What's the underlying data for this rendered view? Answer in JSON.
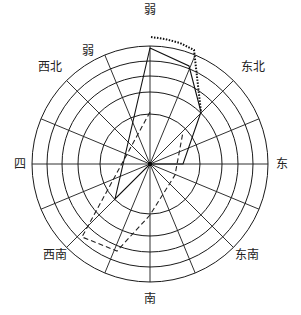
{
  "chart_data": {
    "type": "polar-line",
    "title": "",
    "center": [
      150,
      164
    ],
    "ring_radii_px": [
      50,
      72,
      88,
      103,
      118
    ],
    "ring_count": 5,
    "spoke_count": 16,
    "direction_labels": [
      {
        "text": "弱",
        "x": 150,
        "y": 14,
        "pos": "top"
      },
      {
        "text": "弱",
        "x": 88,
        "y": 55,
        "pos": "upper-left-inner"
      },
      {
        "text": "西北",
        "x": 50,
        "y": 71,
        "pos": "northwest"
      },
      {
        "text": "东北",
        "x": 253,
        "y": 71,
        "pos": "northeast"
      },
      {
        "text": "四",
        "x": 20,
        "y": 168,
        "pos": "west"
      },
      {
        "text": "东",
        "x": 282,
        "y": 168,
        "pos": "east"
      },
      {
        "text": "西南",
        "x": 55,
        "y": 259,
        "pos": "southwest"
      },
      {
        "text": "东南",
        "x": 247,
        "y": 259,
        "pos": "southeast"
      },
      {
        "text": "南",
        "x": 150,
        "y": 303,
        "pos": "bottom"
      }
    ],
    "series": [
      {
        "name": "solid",
        "style": "solid",
        "color": "#111111",
        "points_px": [
          [
            150,
            48
          ],
          [
            189,
            66
          ],
          [
            201,
            112
          ],
          [
            183,
            164
          ],
          [
            150,
            164
          ],
          [
            115,
            199
          ],
          [
            150,
            48
          ]
        ]
      },
      {
        "name": "dashed",
        "style": "dashed",
        "color": "#222222",
        "points_px": [
          [
            150,
            112
          ],
          [
            82,
            237
          ],
          [
            117,
            251
          ],
          [
            150,
            215
          ],
          [
            175,
            175
          ],
          [
            183,
            132
          ]
        ]
      },
      {
        "name": "dotted",
        "style": "dotted",
        "color": "#111111",
        "points_px": [
          [
            151,
            37
          ],
          [
            165,
            39
          ],
          [
            180,
            43
          ],
          [
            194,
            50
          ],
          [
            201,
            112
          ]
        ]
      }
    ],
    "grid": true,
    "legend": null
  },
  "colors": {
    "grid": "#1a1a1a",
    "background": "#ffffff",
    "text": "#222222"
  }
}
